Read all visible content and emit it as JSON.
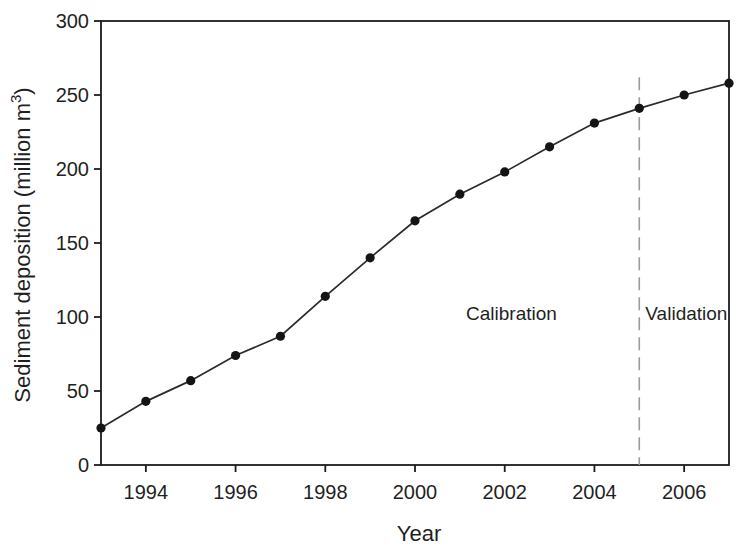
{
  "figure": {
    "background": "#ffffff"
  },
  "chart_data": {
    "type": "line",
    "title": "",
    "xlabel": "Year",
    "ylabel": "Sediment deposition (million m³)",
    "ylabel_parts": [
      "Sediment deposition (million m",
      "3",
      ")"
    ],
    "x": [
      1993,
      1994,
      1995,
      1996,
      1997,
      1998,
      1999,
      2000,
      2001,
      2002,
      2003,
      2004,
      2005,
      2006,
      2007
    ],
    "y": [
      25,
      43,
      57,
      74,
      87,
      114,
      140,
      165,
      183,
      198,
      215,
      231,
      241,
      250,
      258
    ],
    "xlim": [
      1993,
      2007
    ],
    "ylim": [
      0,
      300
    ],
    "x_ticks": [
      1994,
      1996,
      1998,
      2000,
      2002,
      2004,
      2006
    ],
    "y_ticks": [
      0,
      50,
      100,
      150,
      200,
      250,
      300
    ],
    "grid": false,
    "legend": "none",
    "marker": "filled-circle",
    "colors": {
      "line": "#2b2b2b",
      "marker": "#141414",
      "axis": "#1c1c1c",
      "divider": "#9b9b9b",
      "text": "#1f1f1f"
    },
    "divider": {
      "x": 2005,
      "y_span": [
        0,
        262
      ],
      "style": "long-dash",
      "labels": [
        {
          "text": "Calibration",
          "x": 2002.15,
          "y": 103,
          "side": "left"
        },
        {
          "text": "Validation",
          "x": 2006.05,
          "y": 103,
          "side": "right"
        }
      ]
    }
  }
}
